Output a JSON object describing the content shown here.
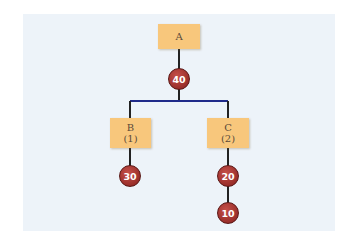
{
  "diagram": {
    "type": "tree",
    "colors": {
      "background": "#edf3f9",
      "box_fill": "#f8c77c",
      "node_fill": "#a33430",
      "branch_line": "#1f2a8a",
      "stem_line": "#222222"
    },
    "boxes": [
      {
        "id": "A",
        "label": "A",
        "sub": ""
      },
      {
        "id": "B",
        "label": "B",
        "sub": "(1)"
      },
      {
        "id": "C",
        "label": "C",
        "sub": "(2)"
      }
    ],
    "nodes": [
      {
        "id": "n40",
        "value": "40",
        "parent": "A"
      },
      {
        "id": "n30",
        "value": "30",
        "parent": "B"
      },
      {
        "id": "n20",
        "value": "20",
        "parent": "C"
      },
      {
        "id": "n10",
        "value": "10",
        "parent": "n20"
      }
    ]
  }
}
